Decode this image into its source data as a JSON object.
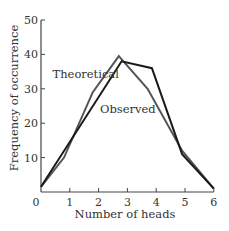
{
  "chart_data": {
    "type": "line",
    "title": "",
    "xlabel": "Number of heads",
    "ylabel": "Frequency of occurrence",
    "xlim": [
      0,
      6
    ],
    "ylim": [
      0,
      50
    ],
    "x_ticks": [
      0,
      1,
      2,
      3,
      4,
      5,
      6
    ],
    "y_ticks": [
      10,
      20,
      30,
      40,
      50
    ],
    "grid": false,
    "legend": "inline labels",
    "series": [
      {
        "name": "Theoretical",
        "color": "#555555",
        "points": [
          [
            0,
            1.5
          ],
          [
            0.8,
            10
          ],
          [
            1.8,
            29
          ],
          [
            2.7,
            39.5
          ],
          [
            3.7,
            30
          ],
          [
            4.9,
            12
          ],
          [
            6,
            1
          ]
        ]
      },
      {
        "name": "Observed",
        "color": "#1a1a1a",
        "points": [
          [
            0,
            1.5
          ],
          [
            2.8,
            38
          ],
          [
            3.85,
            36
          ],
          [
            4.9,
            11
          ],
          [
            6,
            1
          ]
        ]
      }
    ],
    "annotations": [
      {
        "text": "Theoretical",
        "x": 0.4,
        "y": 33
      },
      {
        "text": "Observed",
        "x": 2.05,
        "y": 23
      }
    ]
  }
}
